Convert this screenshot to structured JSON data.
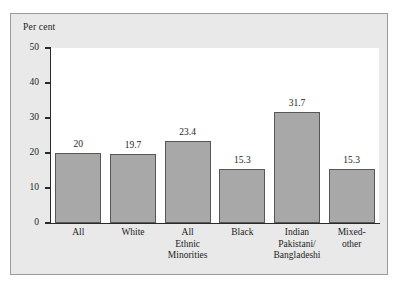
{
  "chart_data": {
    "type": "bar",
    "title": "",
    "subtitle": "",
    "xlabel": "",
    "ylabel": "Per cent",
    "ylim": [
      0,
      50
    ],
    "ytick_labels": [
      "0",
      "10",
      "20",
      "30",
      "40",
      "50"
    ],
    "ytick_values": [
      0,
      10,
      20,
      30,
      40,
      50
    ],
    "grid": false,
    "legend": null,
    "categories": [
      "All",
      "White",
      "All Ethnic Minorities",
      "Black",
      "Indian Pakistani/ Bangladeshi",
      "Mixed-other"
    ],
    "category_lines": [
      [
        "All"
      ],
      [
        "White"
      ],
      [
        "All",
        "Ethnic",
        "Minorities"
      ],
      [
        "Black"
      ],
      [
        "Indian",
        "Pakistani/",
        "Bangladeshi"
      ],
      [
        "Mixed-",
        "other"
      ]
    ],
    "values": [
      20,
      19.7,
      23.4,
      15.3,
      31.7,
      15.3
    ],
    "value_labels": [
      "20",
      "19.7",
      "23.4",
      "15.3",
      "31.7",
      "15.3"
    ],
    "colors": {
      "bar_fill": "#a8a8a8",
      "bar_stroke": "#575757",
      "plot_background": "#ffffff",
      "panel_background": "#e9e9e9",
      "panel_border": "#9a9a9a",
      "axis": "#2a2a2a",
      "text": "#1c1c1c"
    }
  }
}
